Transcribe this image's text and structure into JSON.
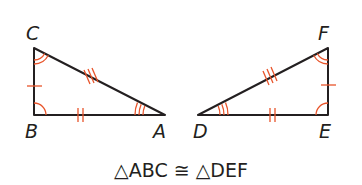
{
  "diagram": {
    "colors": {
      "edge": "#231f20",
      "marks": "#e8542a",
      "background": "#ffffff"
    },
    "triangles": [
      {
        "name": "ABC",
        "vertices": {
          "A": [
            165,
            115
          ],
          "B": [
            34,
            115
          ],
          "C": [
            34,
            48
          ]
        },
        "labels": {
          "A": "A",
          "B": "B",
          "C": "C"
        },
        "right_angle_at": "B",
        "angle_marks": {
          "A": 3,
          "B": 1,
          "C": 2
        },
        "side_ticks": {
          "BC": 1,
          "AB": 2,
          "AC": 3
        }
      },
      {
        "name": "DEF",
        "vertices": {
          "D": [
            198,
            115
          ],
          "E": [
            328,
            115
          ],
          "F": [
            328,
            48
          ]
        },
        "labels": {
          "D": "D",
          "E": "E",
          "F": "F"
        },
        "right_angle_at": "E",
        "angle_marks": {
          "D": 3,
          "E": 1,
          "F": 2
        },
        "side_ticks": {
          "EF": 1,
          "DE": 2,
          "DF": 3
        }
      }
    ],
    "caption": "△ABC ≅ △DEF"
  }
}
